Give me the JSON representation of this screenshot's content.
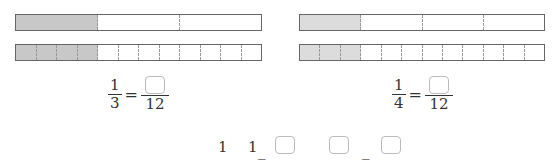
{
  "left": {
    "top_bar": {
      "parts": 3,
      "shaded": 1,
      "shade_color": "#c8c8c8"
    },
    "bottom_bar": {
      "parts": 12,
      "shaded": 4,
      "shade_color": "#c8c8c8"
    },
    "equation": {
      "num": "1",
      "den": "3",
      "equals": "=",
      "rhs_den": "12"
    }
  },
  "right": {
    "top_bar": {
      "parts": 4,
      "shaded": 1,
      "shade_color": "#dcdcdc"
    },
    "bottom_bar": {
      "parts": 12,
      "shaded": 3,
      "shade_color": "#dcdcdc"
    },
    "equation": {
      "num": "1",
      "den": "4",
      "equals": "=",
      "rhs_den": "12"
    }
  },
  "bottom_row": {
    "a": "1",
    "b": "1",
    "dash1": "_",
    "dash2": "_"
  }
}
